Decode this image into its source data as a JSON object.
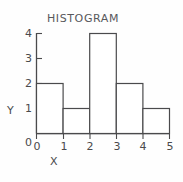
{
  "chart_data": {
    "type": "bar",
    "title": "HISTOGRAM",
    "xlabel": "X",
    "ylabel": "Y",
    "categories": [
      "0-1",
      "1-2",
      "2-3",
      "3-4",
      "4-5"
    ],
    "bin_edges": [
      0,
      1,
      2,
      3,
      4,
      5
    ],
    "values": [
      2,
      1,
      4,
      2,
      1
    ],
    "xlim": [
      0,
      5
    ],
    "ylim": [
      0,
      4
    ],
    "x_ticks": [
      "0",
      "1",
      "2",
      "3",
      "4",
      "5"
    ],
    "y_ticks": [
      "0",
      "1",
      "2",
      "3",
      "4"
    ],
    "grid": false,
    "legend": false,
    "bar_fill": "#ffffff",
    "line_color": "#4a4a4c"
  }
}
